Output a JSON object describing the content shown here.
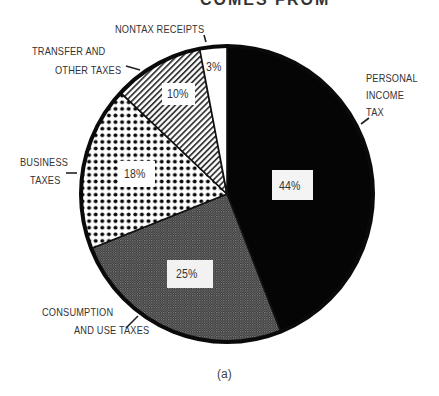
{
  "chart_data": {
    "type": "pie",
    "title_visible_fragment": "COMES FROM",
    "caption": "(a)",
    "start_angle_deg": 0,
    "direction": "clockwise",
    "slices": [
      {
        "name": "PERSONAL INCOME TAX",
        "label_lines": [
          "PERSONAL",
          "INCOME",
          "TAX"
        ],
        "value": 44,
        "value_label": "44%",
        "pattern": "solid-black",
        "color": "#050505"
      },
      {
        "name": "CONSUMPTION AND USE TAXES",
        "label_lines": [
          "CONSUMPTION",
          "AND USE TAXES"
        ],
        "value": 25,
        "value_label": "25%",
        "pattern": "fine-crosshatch",
        "color": "#4a4a4a"
      },
      {
        "name": "BUSINESS TAXES",
        "label_lines": [
          "BUSINESS",
          "TAXES"
        ],
        "value": 18,
        "value_label": "18%",
        "pattern": "large-dots",
        "color": "#111111"
      },
      {
        "name": "TRANSFER AND OTHER TAXES",
        "label_lines": [
          "TRANSFER AND",
          "OTHER TAXES"
        ],
        "value": 10,
        "value_label": "10%",
        "pattern": "diagonal-lines",
        "color": "#555555"
      },
      {
        "name": "NONTAX RECEIPTS",
        "label_lines": [
          "NONTAX RECEIPTS"
        ],
        "value": 3,
        "value_label": "3%",
        "pattern": "white",
        "color": "#ffffff"
      }
    ],
    "legend": "none (callout labels with leader lines)"
  },
  "labels": {
    "title_fragment": "COMES FROM",
    "personal_1": "PERSONAL",
    "personal_2": "INCOME",
    "personal_3": "TAX",
    "consumption_1": "CONSUMPTION",
    "consumption_2": "AND USE TAXES",
    "business_1": "BUSINESS",
    "business_2": "TAXES",
    "transfer_1": "TRANSFER AND",
    "transfer_2": "OTHER TAXES",
    "nontax_1": "NONTAX RECEIPTS",
    "pct_personal": "44%",
    "pct_consumption": "25%",
    "pct_business": "18%",
    "pct_transfer": "10%",
    "pct_nontax": "3%",
    "caption": "(a)"
  }
}
